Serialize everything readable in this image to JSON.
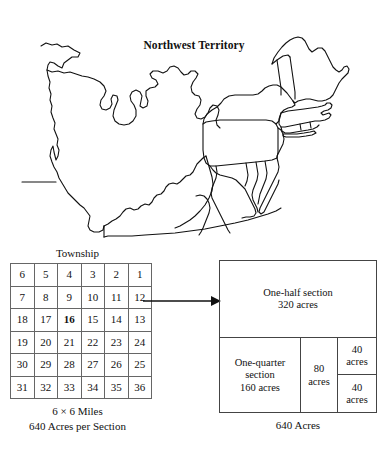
{
  "map": {
    "title": "Northwest Territory",
    "icon": "us-eastern-states-outline-map"
  },
  "township": {
    "caption_top": "Township",
    "caption_size": "6 × 6 Miles",
    "caption_acres": "640 Acres per Section",
    "highlight_section": "16",
    "rows": [
      [
        "6",
        "5",
        "4",
        "3",
        "2",
        "1"
      ],
      [
        "7",
        "8",
        "9",
        "10",
        "11",
        "12"
      ],
      [
        "18",
        "17",
        "16",
        "15",
        "14",
        "13"
      ],
      [
        "19",
        "20",
        "21",
        "22",
        "23",
        "24"
      ],
      [
        "30",
        "29",
        "28",
        "27",
        "26",
        "25"
      ],
      [
        "31",
        "32",
        "33",
        "34",
        "35",
        "36"
      ]
    ]
  },
  "arrow": {
    "icon": "right-arrow-icon"
  },
  "section": {
    "half": {
      "line1": "One-half section",
      "line2": "320 acres"
    },
    "quarter": {
      "line1": "One-quarter",
      "line2": "section",
      "line3": "160 acres"
    },
    "eighty": {
      "line1": "80",
      "line2": "acres"
    },
    "forty_top": {
      "line1": "40",
      "line2": "acres"
    },
    "forty_bottom": {
      "line1": "40",
      "line2": "acres"
    },
    "caption": "640 Acres"
  },
  "colors": {
    "ink": "#111111",
    "rule": "#444444",
    "background": "#ffffff"
  }
}
